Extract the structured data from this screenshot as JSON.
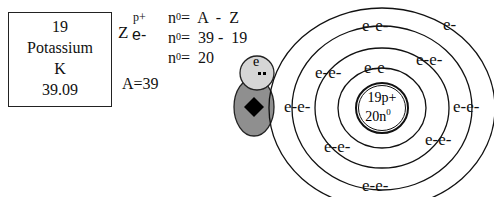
{
  "element_card": {
    "atomic_number": "19",
    "name": "Potassium",
    "symbol": "K",
    "atomic_mass": "39.09"
  },
  "notation": {
    "z_label": "Z",
    "proton_label": "p+",
    "electron_label": "e-",
    "mass_number": "A=39"
  },
  "neutron_calc": {
    "lines": [
      {
        "lhs": "n",
        "sup": "0",
        "rhs": "=  A  -  Z"
      },
      {
        "lhs": "n",
        "sup": "0",
        "rhs": "=  39 -  19"
      },
      {
        "lhs": "n",
        "sup": "0",
        "rhs": "=  20"
      }
    ]
  },
  "character": {
    "head_label": "e"
  },
  "atom": {
    "nucleus_line1": "19p+",
    "nucleus_line2": "20n",
    "nucleus_sup": "0",
    "electron_labels": {
      "ring1": [
        "e-e-"
      ],
      "ring2": [
        "e-e-",
        "e-e-",
        "e-e-",
        "e-e-"
      ],
      "ring3": [
        "e-e-",
        "e-e-",
        "e-e-",
        "e-e-"
      ],
      "ring4": [
        "e-"
      ]
    },
    "shell_counts": [
      2,
      8,
      8,
      1
    ]
  }
}
